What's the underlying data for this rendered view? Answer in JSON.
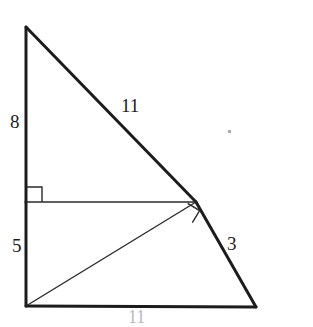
{
  "figure": {
    "background_color": "#ffffff",
    "stroke_color": "#1c1c1c",
    "thick_stroke_width": 3,
    "thin_stroke_width": 1.2,
    "labels": {
      "left_upper": "8",
      "left_lower": "5",
      "hypotenuse_upper": "11",
      "hypotenuse_lower": "3",
      "base_clipped": "11"
    },
    "points": {
      "apex": {
        "x": 26,
        "y": 27
      },
      "bottom_left": {
        "x": 26,
        "y": 306
      },
      "bottom_right": {
        "x": 256,
        "y": 307
      },
      "bend": {
        "x": 196,
        "y": 202
      },
      "left_mid": {
        "x": 26,
        "y": 202
      }
    },
    "right_angle_markers": [
      {
        "name": "left-right-angle",
        "x": 27,
        "y": 186,
        "size": 15,
        "rotation": 0
      },
      {
        "name": "bend-right-angle",
        "x": 190,
        "y": 213,
        "size": 15,
        "rotation": 32
      }
    ],
    "segments": [
      {
        "name": "left-vertical-upper",
        "weight": "thick"
      },
      {
        "name": "left-vertical-lower",
        "weight": "thick"
      },
      {
        "name": "base",
        "weight": "thick"
      },
      {
        "name": "hypotenuse-upper",
        "weight": "thick"
      },
      {
        "name": "hypotenuse-lower",
        "weight": "thick"
      },
      {
        "name": "interior-horizontal",
        "weight": "thin"
      },
      {
        "name": "interior-diagonal",
        "weight": "thin"
      }
    ]
  }
}
